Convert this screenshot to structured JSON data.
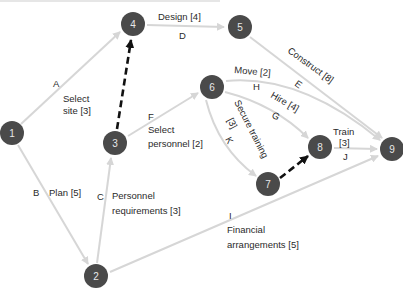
{
  "title_cropped": "",
  "colors": {
    "node_fill": "#4a4a4a",
    "node_text": "#e8e8e8",
    "edge": "#d6d6d6",
    "dummy_edge": "#111111",
    "label": "#2a2a2a"
  },
  "nodes": [
    {
      "id": "1",
      "label": "1",
      "x": 12,
      "y": 133
    },
    {
      "id": "2",
      "label": "2",
      "x": 96,
      "y": 276
    },
    {
      "id": "3",
      "label": "3",
      "x": 115,
      "y": 143
    },
    {
      "id": "4",
      "label": "4",
      "x": 133,
      "y": 24
    },
    {
      "id": "5",
      "label": "5",
      "x": 240,
      "y": 27
    },
    {
      "id": "6",
      "label": "6",
      "x": 212,
      "y": 87
    },
    {
      "id": "7",
      "label": "7",
      "x": 268,
      "y": 184
    },
    {
      "id": "8",
      "label": "8",
      "x": 320,
      "y": 147
    },
    {
      "id": "9",
      "label": "9",
      "x": 392,
      "y": 149
    }
  ],
  "activities": [
    {
      "letter": "A",
      "name": "Select site",
      "duration": "[3]",
      "from": "1",
      "to": "4"
    },
    {
      "letter": "B",
      "name": "Plan",
      "duration": "[5]",
      "from": "1",
      "to": "2"
    },
    {
      "letter": "C",
      "name": "Personnel requirements",
      "duration": "[3]",
      "from": "2",
      "to": "3"
    },
    {
      "letter": "D",
      "name": "Design",
      "duration": "[4]",
      "from": "4",
      "to": "5"
    },
    {
      "letter": "E",
      "name": "Construct",
      "duration": "[8]",
      "from": "5",
      "to": "9"
    },
    {
      "letter": "F",
      "name": "Select personnel",
      "duration": "[2]",
      "from": "3",
      "to": "6"
    },
    {
      "letter": "G",
      "name": "Hire",
      "duration": "[4]",
      "from": "6",
      "to": "8"
    },
    {
      "letter": "H",
      "name": "Move",
      "duration": "[2]",
      "from": "6",
      "to": "9"
    },
    {
      "letter": "I",
      "name": "Financial arrangements",
      "duration": "[5]",
      "from": "2",
      "to": "9"
    },
    {
      "letter": "J",
      "name": "Train",
      "duration": "[3]",
      "from": "8",
      "to": "9"
    },
    {
      "letter": "K",
      "name": "Secure training",
      "duration": "[3]",
      "from": "6",
      "to": "7"
    }
  ],
  "dummy_activities": [
    {
      "from": "3",
      "to": "4"
    },
    {
      "from": "7",
      "to": "8"
    }
  ],
  "labels": {
    "A": "A",
    "A_text1": "Select",
    "A_text2": "site [3]",
    "B": "B",
    "B_text": "Plan [5]",
    "C": "C",
    "C_text1": "Personnel",
    "C_text2": "requirements [3]",
    "D": "D",
    "D_text": "Design [4]",
    "E": "E",
    "E_text": "Construct [8]",
    "F": "F",
    "F_text1": "Select",
    "F_text2": "personnel [2]",
    "G": "G",
    "G_text": "Hire [4]",
    "H": "H",
    "H_text": "Move [2]",
    "I": "I",
    "I_text1": "Financial",
    "I_text2": "arrangements [5]",
    "J": "J",
    "J_text1": "Train",
    "J_text2": "[3]",
    "K": "K",
    "K_text1": "Secure training",
    "K_text2": "[3]"
  }
}
